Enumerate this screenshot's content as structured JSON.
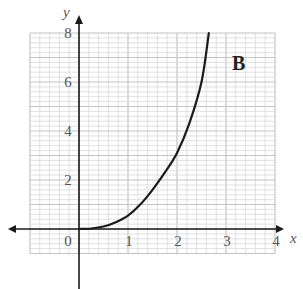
{
  "chart_data": {
    "type": "line",
    "title": "",
    "panel_label": "B",
    "xlabel": "x",
    "ylabel": "y",
    "xlim": [
      -1,
      4
    ],
    "ylim": [
      -1,
      8
    ],
    "x_ticks": [
      0,
      1,
      2,
      3,
      4
    ],
    "x_tick_labels": [
      "0",
      "1",
      "2",
      "3",
      "4"
    ],
    "y_ticks": [
      2,
      4,
      6,
      8
    ],
    "y_tick_labels": [
      "2",
      "4",
      "6",
      "8"
    ],
    "origin_label": "0",
    "grid": true,
    "grid_minor_per_unit_x": 5,
    "grid_minor_per_unit_y": 5,
    "legend": null,
    "series": [
      {
        "name": "curve",
        "x": [
          0,
          0.25,
          0.5,
          0.75,
          1.0,
          1.25,
          1.5,
          1.75,
          2.0,
          2.25,
          2.5,
          2.65
        ],
        "y": [
          0,
          0.02,
          0.1,
          0.28,
          0.55,
          1.0,
          1.6,
          2.3,
          3.1,
          4.3,
          6.0,
          8.0
        ]
      }
    ]
  },
  "colors": {
    "grid_minor": "#d9d9d9",
    "grid_major": "#c4c4c4",
    "axis": "#1a1a1a",
    "curve": "#1a1a1a",
    "text": "#555555"
  }
}
